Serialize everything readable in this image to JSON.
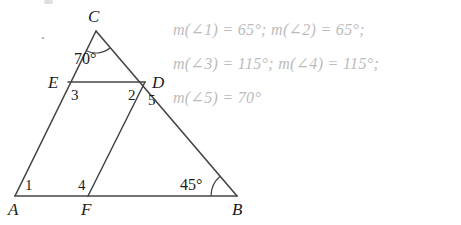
{
  "figure": {
    "stroke_color": "#454545",
    "label_color": "#1b1b1b",
    "vertices": [
      {
        "name": "A",
        "label": "A",
        "x": 15,
        "y": 196
      },
      {
        "name": "B",
        "label": "B",
        "x": 237,
        "y": 196
      },
      {
        "name": "C",
        "label": "C",
        "x": 96,
        "y": 31
      },
      {
        "name": "D",
        "label": "D",
        "x": 145,
        "y": 82
      },
      {
        "name": "E",
        "label": "E",
        "x": 68,
        "y": 82
      },
      {
        "name": "F",
        "label": "F",
        "x": 88,
        "y": 196
      }
    ],
    "segments": [
      {
        "name": "segment-AB",
        "from": "A",
        "to": "B"
      },
      {
        "name": "segment-AC",
        "from": "A",
        "to": "C"
      },
      {
        "name": "segment-CB",
        "from": "C",
        "to": "B"
      },
      {
        "name": "segment-ED",
        "from": "E",
        "to": "D"
      },
      {
        "name": "segment-FD",
        "from": "F",
        "to": "D"
      }
    ],
    "vertex_labels": [
      {
        "name": "vertex-label-C",
        "text": "C",
        "x": 88,
        "y": 8
      },
      {
        "name": "vertex-label-E",
        "text": "E",
        "x": 48,
        "y": 74
      },
      {
        "name": "vertex-label-D",
        "text": "D",
        "x": 152,
        "y": 74
      },
      {
        "name": "vertex-label-A",
        "text": "A",
        "x": 8,
        "y": 201
      },
      {
        "name": "vertex-label-F",
        "text": "F",
        "x": 81,
        "y": 201
      },
      {
        "name": "vertex-label-B",
        "text": "B",
        "x": 232,
        "y": 201
      }
    ],
    "angle_numbers": [
      {
        "name": "angle-number-1",
        "text": "1",
        "x": 25,
        "y": 178
      },
      {
        "name": "angle-number-2",
        "text": "2",
        "x": 128,
        "y": 88
      },
      {
        "name": "angle-number-3",
        "text": "3",
        "x": 71,
        "y": 88
      },
      {
        "name": "angle-number-4",
        "text": "4",
        "x": 78,
        "y": 178
      },
      {
        "name": "angle-number-5",
        "text": "5",
        "x": 148,
        "y": 93
      }
    ],
    "angle_measures": [
      {
        "name": "angle-measure-C",
        "text": "70°",
        "x": 74,
        "y": 51
      },
      {
        "name": "angle-measure-B",
        "text": "45°",
        "x": 180,
        "y": 177
      }
    ]
  },
  "answers": {
    "color": "#bcbcbc",
    "lines": [
      {
        "name": "answer-line-1",
        "text": "m(∠1) = 65°; m(∠2) = 65°;",
        "x": 173,
        "y": 22
      },
      {
        "name": "answer-line-2",
        "text": "m(∠3) = 115°; m(∠4) = 115°;",
        "x": 173,
        "y": 56
      },
      {
        "name": "answer-line-3",
        "text": "m(∠5) = 70°",
        "x": 173,
        "y": 90
      }
    ]
  }
}
